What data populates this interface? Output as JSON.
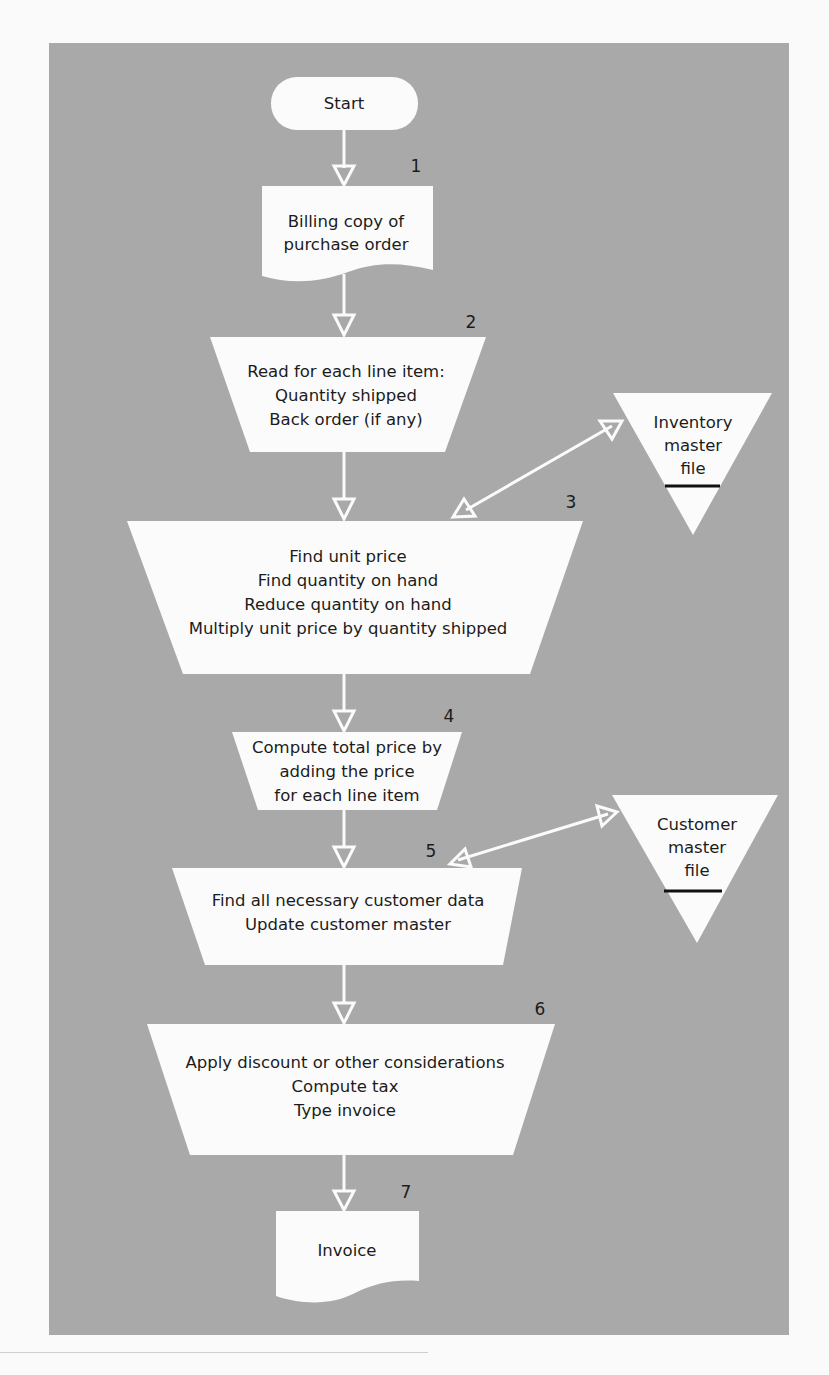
{
  "colors": {
    "background": "#fafafa",
    "panel": "#a9a9a9",
    "shape_fill": "#fbfbfb",
    "text": "#1c1c1c"
  },
  "flowchart": {
    "start": {
      "label": "Start"
    },
    "steps": [
      {
        "number": "1",
        "type": "document",
        "lines": [
          "Billing copy of",
          "purchase order"
        ]
      },
      {
        "number": "2",
        "type": "manual-operation",
        "lines": [
          "Read for each line item:",
          "Quantity shipped",
          "Back order (if any)"
        ]
      },
      {
        "number": "3",
        "type": "manual-operation",
        "lines": [
          "Find unit price",
          "Find quantity on hand",
          "Reduce quantity on hand",
          "Multiply unit price by quantity shipped"
        ]
      },
      {
        "number": "4",
        "type": "manual-operation",
        "lines": [
          "Compute total price by",
          "adding the price",
          "for each line item"
        ]
      },
      {
        "number": "5",
        "type": "manual-operation",
        "lines": [
          "Find all necessary customer data",
          "Update customer master"
        ]
      },
      {
        "number": "6",
        "type": "manual-operation",
        "lines": [
          "Apply discount or other considerations",
          "Compute tax",
          "Type invoice"
        ]
      },
      {
        "number": "7",
        "type": "document",
        "lines": [
          "Invoice"
        ]
      }
    ],
    "files": [
      {
        "name": "inventory",
        "lines": [
          "Inventory",
          "master",
          "file"
        ],
        "connects_to_step": "3"
      },
      {
        "name": "customer",
        "lines": [
          "Customer",
          "master",
          "file"
        ],
        "connects_to_step": "5"
      }
    ]
  }
}
